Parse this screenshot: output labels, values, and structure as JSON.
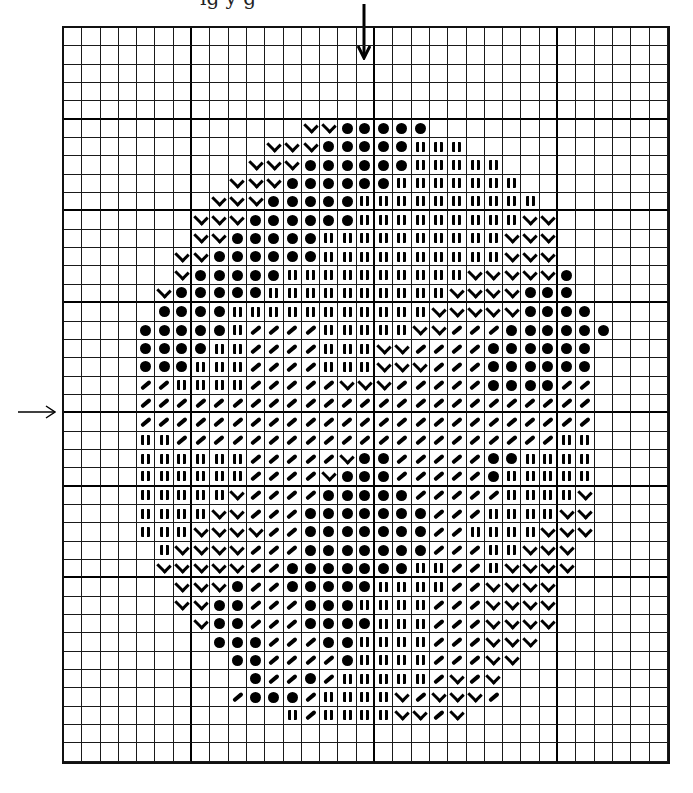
{
  "figure": {
    "type": "knitting-chart",
    "columns": 33,
    "rows": 40,
    "thick_line_every_cols": [
      6,
      16,
      26
    ],
    "thick_line_every_rows": [
      4,
      9,
      14,
      20,
      24,
      29
    ],
    "center_column_marker": "arrow-down",
    "center_row_marker": "arrow-right",
    "legend_symbols": {
      "v": "check-mark",
      "o": "filled-dot",
      "i": "double-bar",
      "s": "slash",
      ".": "empty"
    },
    "pattern": [
      {
        "row": 5,
        "start": 13,
        "cells": "vvooooo"
      },
      {
        "row": 6,
        "start": 11,
        "cells": "vvvoooooiii"
      },
      {
        "row": 7,
        "start": 10,
        "cells": "vvvooooooiiiii"
      },
      {
        "row": 8,
        "start": 9,
        "cells": "vvvooooooiiiiiii"
      },
      {
        "row": 9,
        "start": 8,
        "cells": "vvvoooooiiiiiiiiii"
      },
      {
        "row": 10,
        "start": 7,
        "cells": "vvvooooooiiiiiiiiivv"
      },
      {
        "row": 11,
        "start": 7,
        "cells": "vvoooooiiiiiiiiiivvv"
      },
      {
        "row": 12,
        "start": 6,
        "cells": "vvooooooiiiiiiiiiivvv"
      },
      {
        "row": 13,
        "start": 6,
        "cells": "voooooiiiiiiiiiivvvvvo"
      },
      {
        "row": 14,
        "start": 5,
        "cells": "voooooiiiiiiiiiivvvvooo"
      },
      {
        "row": 15,
        "start": 5,
        "cells": "ooooiiiiiiiiiiivvvvvoooo"
      },
      {
        "row": 16,
        "start": 4,
        "cells": "oooooissssiiiiivvsssoooooo"
      },
      {
        "row": 17,
        "start": 4,
        "cells": "ooooiissssiiivvssssoooooo"
      },
      {
        "row": 18,
        "start": 4,
        "cells": "oooiiissssiiivvvsssoooooo"
      },
      {
        "row": 19,
        "start": 4,
        "cells": "ssiiiisssssvvvsssssooooss"
      },
      {
        "row": 20,
        "start": 4,
        "cells": "sssssssssssssssssssssssss"
      },
      {
        "row": 21,
        "start": 4,
        "cells": "sssssssssssssssssssssssss"
      },
      {
        "row": 22,
        "start": 4,
        "cells": "iisssssssssssssssssssssii"
      },
      {
        "row": 23,
        "start": 4,
        "cells": "iiiiiisssssvoosssssooiiii"
      },
      {
        "row": 24,
        "start": 4,
        "cells": "iiiiiissssvooosssssoiiiii"
      },
      {
        "row": 25,
        "start": 4,
        "cells": "iiiiivssssooooosssssiiiiv"
      },
      {
        "row": 26,
        "start": 4,
        "cells": "iiiivvsssooooooosssiiiivv"
      },
      {
        "row": 27,
        "start": 4,
        "cells": "iiivvvvssooooooossiiiivvv"
      },
      {
        "row": 28,
        "start": 5,
        "cells": "ivvvvsssooooooosssiivvv"
      },
      {
        "row": 29,
        "start": 5,
        "cells": "vvvvvssoooooooiissivvvv"
      },
      {
        "row": 30,
        "start": 6,
        "cells": "vvvossoooooiiiissvvvv"
      },
      {
        "row": 31,
        "start": 6,
        "cells": "vvoosssoooiiiisssvvvv"
      },
      {
        "row": 32,
        "start": 7,
        "cells": "voosssooooiiisssvvvv"
      },
      {
        "row": 33,
        "start": 8,
        "cells": "ooosssooiiiisssvvv"
      },
      {
        "row": 34,
        "start": 9,
        "cells": "oossssoiiiisssvv"
      },
      {
        "row": 35,
        "start": 10,
        "cells": "ossosiiiiisvsv"
      },
      {
        "row": 36,
        "start": 9,
        "cells": "sooosiiiivsvvvs"
      },
      {
        "row": 37,
        "start": 12,
        "cells": "isiiiivvsv"
      }
    ]
  },
  "markers": {
    "top_arrow": "↓",
    "left_arrow": "→"
  },
  "header_cutoff_text": "ig    y g"
}
